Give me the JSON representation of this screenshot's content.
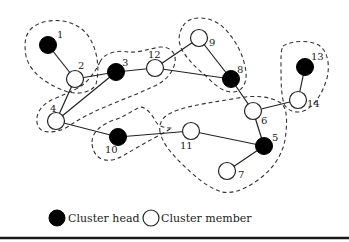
{
  "diagram": {
    "type": "cluster-network",
    "colors": {
      "cluster_head": "#000000",
      "cluster_member": "#ffffff",
      "edge": "#222222",
      "cluster_boundary": "#333333"
    },
    "nodes": [
      {
        "id": "1",
        "role": "head",
        "x": 48,
        "y": 45,
        "label": "1",
        "lx": 57,
        "ly": 38
      },
      {
        "id": "2",
        "role": "member",
        "x": 75,
        "y": 79,
        "label": "2",
        "lx": 78,
        "ly": 69
      },
      {
        "id": "3",
        "role": "head",
        "x": 116,
        "y": 72,
        "label": "3",
        "lx": 122,
        "ly": 66
      },
      {
        "id": "4",
        "role": "member",
        "x": 56,
        "y": 121,
        "label": "4",
        "lx": 50,
        "ly": 112
      },
      {
        "id": "5",
        "role": "head",
        "x": 264,
        "y": 146,
        "label": "5",
        "lx": 272,
        "ly": 141
      },
      {
        "id": "6",
        "role": "member",
        "x": 253,
        "y": 111,
        "label": "6",
        "lx": 261,
        "ly": 124
      },
      {
        "id": "7",
        "role": "member",
        "x": 227,
        "y": 171,
        "label": "7",
        "lx": 238,
        "ly": 178
      },
      {
        "id": "8",
        "role": "head",
        "x": 231,
        "y": 79,
        "label": "8",
        "lx": 237,
        "ly": 73
      },
      {
        "id": "9",
        "role": "member",
        "x": 199,
        "y": 38,
        "label": "9",
        "lx": 209,
        "ly": 46
      },
      {
        "id": "10",
        "role": "head",
        "x": 118,
        "y": 137,
        "label": "10",
        "lx": 105,
        "ly": 153
      },
      {
        "id": "11",
        "role": "member",
        "x": 191,
        "y": 131,
        "label": "11",
        "lx": 180,
        "ly": 149
      },
      {
        "id": "12",
        "role": "member",
        "x": 155,
        "y": 68,
        "label": "12",
        "lx": 148,
        "ly": 58
      },
      {
        "id": "13",
        "role": "head",
        "x": 305,
        "y": 67,
        "label": "13",
        "lx": 311,
        "ly": 60
      },
      {
        "id": "14",
        "role": "member",
        "x": 298,
        "y": 100,
        "label": "14",
        "lx": 307,
        "ly": 107
      }
    ],
    "edges": [
      [
        "1",
        "2"
      ],
      [
        "2",
        "3"
      ],
      [
        "2",
        "4"
      ],
      [
        "3",
        "4"
      ],
      [
        "3",
        "12"
      ],
      [
        "12",
        "9"
      ],
      [
        "12",
        "8"
      ],
      [
        "9",
        "8"
      ],
      [
        "8",
        "6"
      ],
      [
        "6",
        "14"
      ],
      [
        "14",
        "13"
      ],
      [
        "6",
        "5"
      ],
      [
        "5",
        "11"
      ],
      [
        "5",
        "7"
      ],
      [
        "11",
        "10"
      ],
      [
        "10",
        "4"
      ]
    ],
    "clusters": [
      {
        "head": "1",
        "members": [
          "2"
        ]
      },
      {
        "head": "3",
        "members": [
          "2",
          "4",
          "12"
        ]
      },
      {
        "head": "8",
        "members": [
          "9",
          "12"
        ]
      },
      {
        "head": "13",
        "members": [
          "14"
        ]
      },
      {
        "head": "5",
        "members": [
          "6",
          "7",
          "11"
        ]
      },
      {
        "head": "10",
        "members": [
          "4",
          "11"
        ]
      }
    ]
  },
  "legend": {
    "cluster_head_label": "Cluster head",
    "cluster_member_label": "Cluster member"
  }
}
